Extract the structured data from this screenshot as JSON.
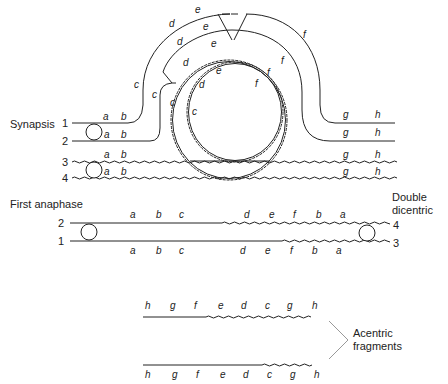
{
  "synapsis": {
    "label": "Synapsis",
    "chromatids": [
      {
        "number": "1",
        "left_genes": [
          "a",
          "b"
        ],
        "right_genes": [
          "g",
          "h"
        ],
        "style": "straight"
      },
      {
        "number": "2",
        "left_genes": [
          "a",
          "b"
        ],
        "right_genes": [
          "g",
          "h"
        ],
        "style": "straight"
      },
      {
        "number": "3",
        "left_genes": [
          "a",
          "b"
        ],
        "right_genes": [
          "g",
          "h"
        ],
        "style": "wavy"
      },
      {
        "number": "4",
        "left_genes": [
          "a",
          "b"
        ],
        "right_genes": [
          "g",
          "h"
        ],
        "style": "wavy"
      }
    ],
    "loop_genes": {
      "outer_1": [
        "c",
        "d",
        "e",
        "f"
      ],
      "inner_2": [
        "c",
        "d",
        "e",
        "f"
      ],
      "wavy_3": [
        "c",
        "d",
        "e",
        "f"
      ],
      "wavy_4": [
        "c",
        "d",
        "e",
        "f"
      ]
    }
  },
  "first_anaphase": {
    "label": "First anaphase",
    "right_label_line1": "Double",
    "right_label_line2": "dicentric",
    "top": {
      "left_number": "2",
      "right_number": "4",
      "genes": [
        "a",
        "b",
        "c",
        "d",
        "e",
        "f",
        "b",
        "a"
      ]
    },
    "bottom": {
      "left_number": "1",
      "right_number": "3",
      "genes": [
        "a",
        "b",
        "c",
        "d",
        "e",
        "f",
        "b",
        "a"
      ]
    }
  },
  "fragments": {
    "label_line1": "Acentric",
    "label_line2": "fragments",
    "top": {
      "genes": [
        "h",
        "g",
        "f",
        "e",
        "d",
        "c",
        "g",
        "h"
      ]
    },
    "bottom": {
      "genes": [
        "h",
        "g",
        "f",
        "e",
        "d",
        "c",
        "g",
        "h"
      ]
    }
  }
}
